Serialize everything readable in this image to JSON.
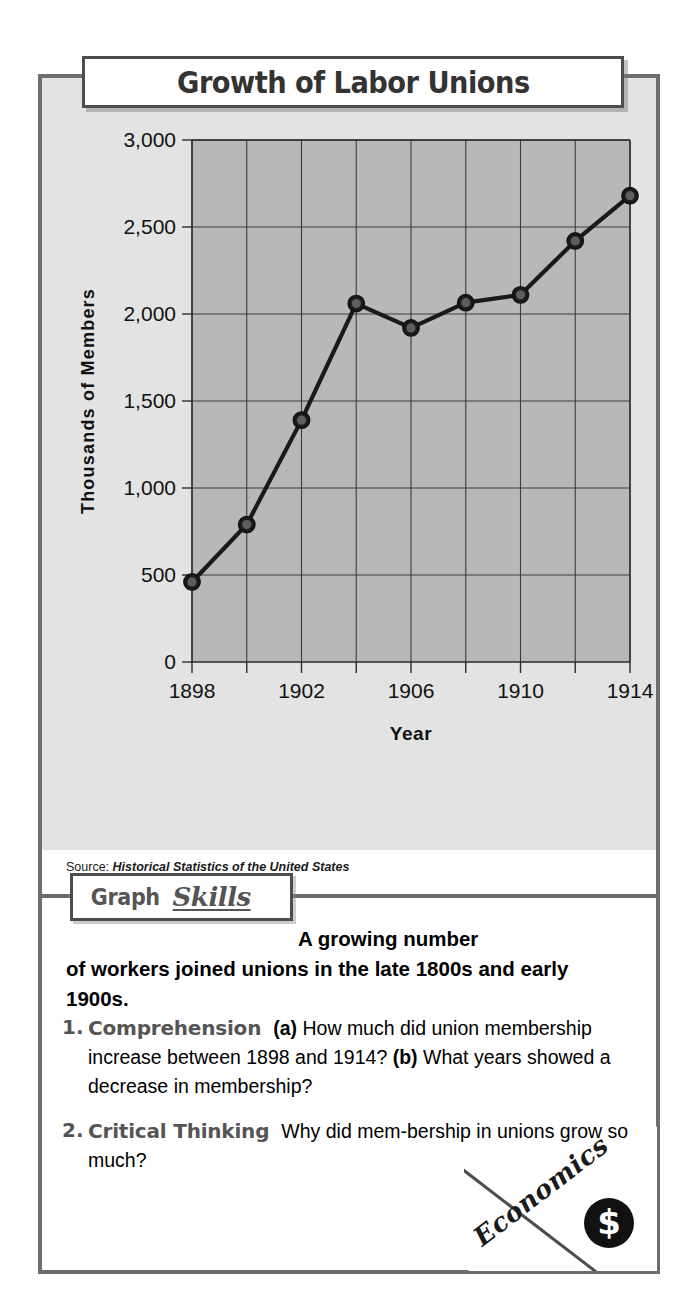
{
  "figure": {
    "title": "Growth of Labor Unions",
    "source_prefix": "Source:",
    "source_title": "Historical Statistics of the United States"
  },
  "skills_badge": {
    "word1": "Graph",
    "word2": "Skills"
  },
  "intro": {
    "line1": "A growing number",
    "line2": "of workers joined unions in the late 1800s",
    "line3": "and early 1900s."
  },
  "questions": [
    {
      "number": "1.",
      "label": "Comprehension",
      "part_a": "(a)",
      "text_a": "How much did union membership increase between 1898 and 1914?",
      "part_b": "(b)",
      "text_b": "What years showed a decrease in membership?"
    },
    {
      "number": "2.",
      "label": "Critical Thinking",
      "text": "Why did mem-bership in unions grow so much?"
    }
  ],
  "corner_badge": {
    "word": "Economics",
    "coin_symbol": "$"
  },
  "chart_data": {
    "type": "line",
    "title": "Growth of Labor Unions",
    "xlabel": "Year",
    "ylabel": "Thousands of Members",
    "x": [
      1898,
      1900,
      1902,
      1904,
      1906,
      1908,
      1910,
      1912,
      1914
    ],
    "values": [
      460,
      790,
      1390,
      2060,
      1920,
      2065,
      2110,
      2420,
      2680
    ],
    "xlim": [
      1898,
      1914
    ],
    "ylim": [
      0,
      3000
    ],
    "x_ticks": [
      1898,
      1900,
      1902,
      1904,
      1906,
      1908,
      1910,
      1912,
      1914
    ],
    "x_tick_labels": [
      "1898",
      "",
      "1902",
      "",
      "1906",
      "",
      "1910",
      "",
      "1914"
    ],
    "y_ticks": [
      0,
      500,
      1000,
      1500,
      2000,
      2500,
      3000
    ],
    "y_tick_labels": [
      "0",
      "500",
      "1,000",
      "1,500",
      "2,000",
      "2,500",
      "3,000"
    ],
    "grid": true,
    "legend": "none",
    "series_color": "#1a1a1a",
    "plot_bg": "#b8b8b8",
    "panel_bg": "#e3e3e3",
    "marker": "circle"
  }
}
